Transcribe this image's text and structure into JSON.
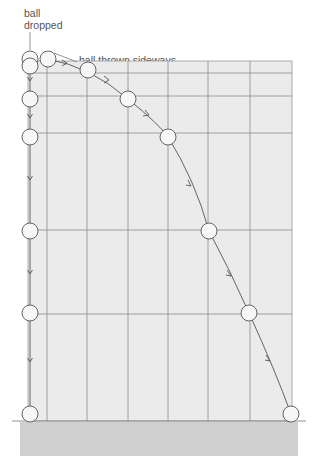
{
  "labels": {
    "ball_dropped_line1": "ball",
    "ball_dropped_line2": "dropped",
    "ball_thrown": "ball thrown sideways"
  },
  "colors": {
    "grid_fill": "#ebebeb",
    "grid_line": "#8a8a8a",
    "ground": "#cfcfcf",
    "ball_fill": "#f7f7f7",
    "ball_stroke": "#555555",
    "path": "#555555",
    "text": "#555555"
  },
  "diagram": {
    "dropped_ball_positions": [
      [
        30,
        59
      ],
      [
        30,
        66
      ],
      [
        30,
        99
      ],
      [
        30,
        137
      ],
      [
        30,
        231
      ],
      [
        30,
        313
      ],
      [
        30,
        414
      ]
    ],
    "thrown_ball_positions": [
      [
        47,
        59
      ],
      [
        88,
        70
      ],
      [
        128,
        99
      ],
      [
        168,
        137
      ],
      [
        209,
        231
      ],
      [
        249,
        313
      ],
      [
        291,
        414
      ]
    ],
    "grid_vertical_x": [
      47,
      87,
      128,
      168,
      208,
      250
    ],
    "grid_horizontal_y": [
      63,
      73,
      96,
      133,
      230,
      314
    ],
    "grid_bounds": {
      "x1": 28,
      "y1": 61,
      "x2": 292,
      "y2": 421
    }
  }
}
